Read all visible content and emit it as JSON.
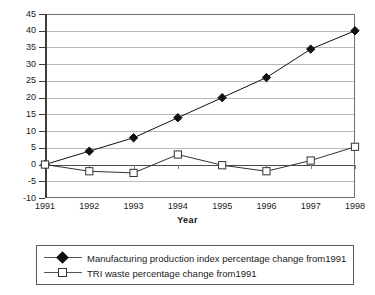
{
  "chart_data": {
    "type": "line",
    "title": "",
    "xlabel": "Year",
    "ylabel": "",
    "grid": true,
    "legend_position": "bottom",
    "categories": [
      "1991",
      "1992",
      "1993",
      "1994",
      "1995",
      "1996",
      "1997",
      "1998"
    ],
    "xlim": [
      1991,
      1998
    ],
    "ylim": [
      -10,
      45
    ],
    "ytick_values": [
      45,
      40,
      35,
      30,
      25,
      20,
      15,
      10,
      5,
      0,
      -5,
      -10
    ],
    "ytick_labels": [
      "45",
      "40",
      "35",
      "30",
      "25",
      "20",
      "15",
      "10",
      "5",
      "0",
      "-5",
      "-10"
    ],
    "ytick_step": 5,
    "series": [
      {
        "name": "Manufacturing production index percentage change from1991",
        "marker": "filled-diamond",
        "color": "#111111",
        "values": [
          0,
          4,
          8,
          14,
          20,
          26,
          34.5,
          40
        ]
      },
      {
        "name": "TRI waste percentage change from1991",
        "marker": "open-square",
        "color": "#333333",
        "values": [
          0,
          -2,
          -2.5,
          3,
          -0.2,
          -2,
          1.2,
          5.3
        ]
      }
    ]
  },
  "axes": {
    "x_title": "Year"
  },
  "legend": {
    "items": [
      {
        "label": "Manufacturing production index percentage change from1991",
        "marker": "filled-diamond"
      },
      {
        "label": "TRI waste percentage change from1991",
        "marker": "open-square"
      }
    ]
  },
  "colors": {
    "plot_border": "#6e6e6e",
    "gridline": "#b9b9b9",
    "zeroline": "#4a4a4a",
    "axis": "#3c3c3c",
    "series_1": "#111111",
    "series_2": "#333333",
    "background": "#ffffff"
  }
}
